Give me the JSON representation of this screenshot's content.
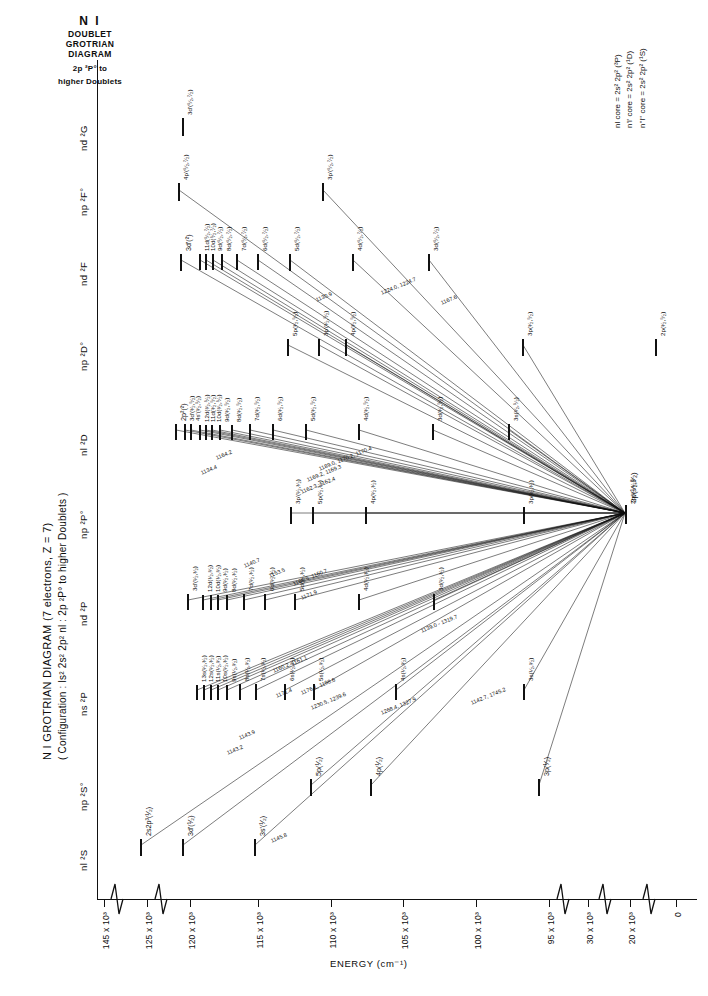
{
  "header": {
    "species": "N I",
    "subtitle_line1": "DOUBLET",
    "subtitle_line2": "GROTRIAN",
    "subtitle_line3": "DIAGRAM",
    "scope_line1": "2p ²P° to",
    "scope_line2": "higher  Doublets"
  },
  "caption": {
    "line1": "N I GROTRIAN DIAGRAM (7 electrons, Z = 7)",
    "line2": "( Configuration : ls² 2s² 2p² nl : 2p ²P° to higher Doublets )"
  },
  "core_legend": {
    "items": [
      "nl core = 2s² 2p² (³P)",
      "n'l' core = 2s² 2p² (¹D)",
      "n''l'' core = 2s² 2p² (¹S)"
    ]
  },
  "axes": {
    "energy_title": "ENERGY (cm⁻¹)",
    "ticks": [
      {
        "label": "145 x 10³",
        "x": 104
      },
      {
        "label": "125 x 10³",
        "x": 147
      },
      {
        "label": "120 x 10³",
        "x": 190
      },
      {
        "label": "115 x 10³",
        "x": 258
      },
      {
        "label": "110 x 10³",
        "x": 331
      },
      {
        "label": "105 x 10³",
        "x": 403
      },
      {
        "label": "100 x 10³",
        "x": 476
      },
      {
        "label": "95 x 10³",
        "x": 549
      },
      {
        "label": "30 x 10³",
        "x": 588
      },
      {
        "label": "20 x 10³",
        "x": 630
      },
      {
        "label": "0",
        "x": 676
      }
    ],
    "breaks_x": [
      116,
      160,
      562,
      604,
      648
    ]
  },
  "columns": [
    {
      "name": "nl-2S",
      "label": "nl ²S",
      "y": 845
    },
    {
      "name": "np-2So",
      "label": "np ²S°",
      "y": 785
    },
    {
      "name": "ns-2P",
      "label": "ns ²P",
      "y": 690
    },
    {
      "name": "nd-2P",
      "label": "nd ²P",
      "y": 600
    },
    {
      "name": "np-2Po",
      "label": "np ²P°",
      "y": 513
    },
    {
      "name": "nl-2D",
      "label": "nl ²D",
      "y": 430
    },
    {
      "name": "np-2Do",
      "label": "np ²D°",
      "y": 345
    },
    {
      "name": "nd-2F",
      "label": "nd ²F",
      "y": 260
    },
    {
      "name": "np-2Fo",
      "label": "np ²F°",
      "y": 190
    },
    {
      "name": "nd-2G",
      "label": "nd ²G",
      "y": 125
    }
  ],
  "levels": [
    {
      "col": "nd-2G",
      "label": "3d'(⁵⁄₂,⁷⁄₂)",
      "x": 182,
      "len": 14
    },
    {
      "col": "np-2Fo",
      "label": "4p'(⁵⁄₂,⁷⁄₂)",
      "x": 178,
      "len": 14
    },
    {
      "col": "np-2Fo",
      "label": "3p'(⁵⁄₂,⁷⁄₂)",
      "x": 322,
      "len": 14
    },
    {
      "col": "nd-2F",
      "label": "3d'(²)",
      "x": 180,
      "len": 13
    },
    {
      "col": "nd-2F",
      "label": "11d(⁵⁄₂,⁷⁄₂)",
      "x": 199,
      "len": 12
    },
    {
      "col": "nd-2F",
      "label": "10d(⁵⁄₂,⁷⁄₂)",
      "x": 205,
      "len": 12
    },
    {
      "col": "nd-2F",
      "label": "9d(⁵⁄₂,⁷⁄₂)",
      "x": 212,
      "len": 12
    },
    {
      "col": "nd-2F",
      "label": "8d(⁵⁄₂,⁷⁄₂)",
      "x": 221,
      "len": 12
    },
    {
      "col": "nd-2F",
      "label": "7d(⁵⁄₂,⁷⁄₂)",
      "x": 236,
      "len": 12
    },
    {
      "col": "nd-2F",
      "label": "6d(⁵⁄₂,⁷⁄₂)",
      "x": 257,
      "len": 12
    },
    {
      "col": "nd-2F",
      "label": "5d(⁵⁄₂,⁷⁄₂)",
      "x": 289,
      "len": 13
    },
    {
      "col": "nd-2F",
      "label": "4d(⁵⁄₂,⁷⁄₂)",
      "x": 352,
      "len": 13
    },
    {
      "col": "nd-2F",
      "label": "3d(⁵⁄₂,⁷⁄₂)",
      "x": 428,
      "len": 13
    },
    {
      "col": "np-2Do",
      "label": "5p(³⁄₂,⁵⁄₂)",
      "x": 287,
      "len": 13
    },
    {
      "col": "np-2Do",
      "label": "3p'(³⁄₂,⁵⁄₂)",
      "x": 318,
      "len": 13
    },
    {
      "col": "np-2Do",
      "label": "4p(³⁄₂,⁵⁄₂)",
      "x": 345,
      "len": 13
    },
    {
      "col": "np-2Do",
      "label": "3p(³⁄₂,⁵⁄₂)",
      "x": 522,
      "len": 13
    },
    {
      "col": "np-2Do",
      "label": "2p(³⁄₂,⁵⁄₂)",
      "x": 655,
      "len": 13
    },
    {
      "col": "nl-2D",
      "label": "2p²(²)",
      "x": 175,
      "len": 12
    },
    {
      "col": "nl-2D",
      "label": "3d'(³⁄₂,⁵⁄₂)",
      "x": 184,
      "len": 12
    },
    {
      "col": "nl-2D",
      "label": "4s'(³⁄₂,⁵⁄₂)",
      "x": 190,
      "len": 12
    },
    {
      "col": "nl-2D",
      "label": "12d(³⁄₂,⁵⁄₂)",
      "x": 199,
      "len": 11
    },
    {
      "col": "nl-2D",
      "label": "11d(³⁄₂,⁵⁄₂)",
      "x": 205,
      "len": 11
    },
    {
      "col": "nl-2D",
      "label": "10d(³⁄₂,⁵⁄₂)",
      "x": 211,
      "len": 11
    },
    {
      "col": "nl-2D",
      "label": "9d(³⁄₂,⁵⁄₂)",
      "x": 219,
      "len": 11
    },
    {
      "col": "nl-2D",
      "label": "8d(³⁄₂,⁵⁄₂)",
      "x": 231,
      "len": 11
    },
    {
      "col": "nl-2D",
      "label": "7d(³⁄₂,⁵⁄₂)",
      "x": 249,
      "len": 12
    },
    {
      "col": "nl-2D",
      "label": "6d(³⁄₂,⁵⁄₂)",
      "x": 272,
      "len": 12
    },
    {
      "col": "nl-2D",
      "label": "5d(³⁄₂,⁵⁄₂)",
      "x": 305,
      "len": 12
    },
    {
      "col": "nl-2D",
      "label": "4d(³⁄₂,⁵⁄₂)",
      "x": 358,
      "len": 12
    },
    {
      "col": "nl-2D",
      "label": "3d(³⁄₂,⁵⁄₂)",
      "x": 432,
      "len": 12
    },
    {
      "col": "nl-2D",
      "label": "3s(³⁄₂,⁵⁄₂)",
      "x": 508,
      "len": 12
    },
    {
      "col": "np-2Po",
      "label": "3p'(¹⁄₂,³⁄₂)",
      "x": 290,
      "len": 13
    },
    {
      "col": "np-2Po",
      "label": "5p(¹⁄₂,³⁄₂)",
      "x": 312,
      "len": 13
    },
    {
      "col": "np-2Po",
      "label": "4p(¹⁄₂,³⁄₂)",
      "x": 365,
      "len": 13
    },
    {
      "col": "np-2Po",
      "label": "3p(¹⁄₂,³⁄₂)",
      "x": 523,
      "len": 13
    },
    {
      "col": "np-2Po",
      "label": "2p(¹⁄₂,³⁄₂)",
      "x": 625,
      "len": 13
    },
    {
      "col": "nd-2P",
      "label": "3d'(¹⁄₂,³⁄₂)",
      "x": 187,
      "len": 12
    },
    {
      "col": "nd-2P",
      "label": "12d(¹⁄₂,³⁄₂)",
      "x": 202,
      "len": 11
    },
    {
      "col": "nd-2P",
      "label": "10d(¹⁄₂,³⁄₂)",
      "x": 210,
      "len": 11
    },
    {
      "col": "nd-2P",
      "label": "9d(¹⁄₂,³⁄₂)",
      "x": 217,
      "len": 11
    },
    {
      "col": "nd-2P",
      "label": "8d(¹⁄₂,³⁄₂)",
      "x": 226,
      "len": 11
    },
    {
      "col": "nd-2P",
      "label": "7d(¹⁄₂,³⁄₂)",
      "x": 243,
      "len": 12
    },
    {
      "col": "nd-2P",
      "label": "6d(¹⁄₂,³⁄₂)",
      "x": 264,
      "len": 12
    },
    {
      "col": "nd-2P",
      "label": "5d(¹⁄₂,³⁄₂)",
      "x": 294,
      "len": 12
    },
    {
      "col": "nd-2P",
      "label": "4d(¹⁄₂,³⁄₂)",
      "x": 358,
      "len": 12
    },
    {
      "col": "nd-2P",
      "label": "3d(¹⁄₂,³⁄₂)",
      "x": 433,
      "len": 12
    },
    {
      "col": "ns-2P",
      "label": "13s(¹⁄₂,³⁄₂)",
      "x": 196,
      "len": 11
    },
    {
      "col": "ns-2P",
      "label": "12s(¹⁄₂,³⁄₂)",
      "x": 203,
      "len": 11
    },
    {
      "col": "ns-2P",
      "label": "11s(¹⁄₂,³⁄₂)",
      "x": 210,
      "len": 11
    },
    {
      "col": "ns-2P",
      "label": "10s(¹⁄₂,³⁄₂)",
      "x": 217,
      "len": 11
    },
    {
      "col": "ns-2P",
      "label": "9s(¹⁄₂,³⁄₂)",
      "x": 226,
      "len": 11
    },
    {
      "col": "ns-2P",
      "label": "8s(¹⁄₂,³⁄₂)",
      "x": 239,
      "len": 12
    },
    {
      "col": "ns-2P",
      "label": "7s(¹⁄₂,³⁄₂)",
      "x": 255,
      "len": 12
    },
    {
      "col": "ns-2P",
      "label": "6s(¹⁄₂,³⁄₂)",
      "x": 284,
      "len": 12
    },
    {
      "col": "ns-2P",
      "label": "5s(¹⁄₂,³⁄₂)",
      "x": 313,
      "len": 12
    },
    {
      "col": "ns-2P",
      "label": "4s(¹⁄₂,³⁄₂)",
      "x": 395,
      "len": 12
    },
    {
      "col": "ns-2P",
      "label": "3s(¹⁄₂,³⁄₂)",
      "x": 523,
      "len": 12
    },
    {
      "col": "np-2So",
      "label": "5p(¹⁄₂)",
      "x": 310,
      "len": 13
    },
    {
      "col": "np-2So",
      "label": "4p(¹⁄₂)",
      "x": 370,
      "len": 13
    },
    {
      "col": "np-2So",
      "label": "3p(¹⁄₂)",
      "x": 538,
      "len": 13
    },
    {
      "col": "nl-2S",
      "label": "2s2p³(¹⁄₂)",
      "x": 140,
      "len": 13
    },
    {
      "col": "nl-2S",
      "label": "3d'(¹⁄₂)",
      "x": 182,
      "len": 13
    },
    {
      "col": "nl-2S",
      "label": "3s'(¹⁄₂)",
      "x": 254,
      "len": 13
    }
  ],
  "wavelengths": [
    {
      "text": "1140.7",
      "x": 243,
      "y": 563
    },
    {
      "text": "1153.5",
      "x": 268,
      "y": 573
    },
    {
      "text": "1160.5, 1160.7",
      "x": 292,
      "y": 581
    },
    {
      "text": "1171.9",
      "x": 300,
      "y": 595
    },
    {
      "text": "1160.2, 1161.1",
      "x": 272,
      "y": 668
    },
    {
      "text": "1171.4",
      "x": 275,
      "y": 693
    },
    {
      "text": "1176.1, 1198.6",
      "x": 300,
      "y": 690
    },
    {
      "text": "1230.5, 1239.6",
      "x": 310,
      "y": 705
    },
    {
      "text": "1268.4, 1327.9",
      "x": 380,
      "y": 710
    },
    {
      "text": "1142.7, 1745.2",
      "x": 470,
      "y": 700
    },
    {
      "text": "1189.0, 1170.2, 1170.4",
      "x": 318,
      "y": 466
    },
    {
      "text": "1169.2, 1169.3",
      "x": 306,
      "y": 477
    },
    {
      "text": "1162.3, 1162.4",
      "x": 300,
      "y": 489
    },
    {
      "text": "1130.9",
      "x": 315,
      "y": 297
    },
    {
      "text": "1224.0, 1224.7",
      "x": 380,
      "y": 290
    },
    {
      "text": "1167.6",
      "x": 440,
      "y": 300
    },
    {
      "text": "1139.0 - 1319.7",
      "x": 420,
      "y": 628
    },
    {
      "text": "1145.8",
      "x": 270,
      "y": 838
    },
    {
      "text": "1143.9",
      "x": 238,
      "y": 735
    },
    {
      "text": "1143.2",
      "x": 226,
      "y": 750
    },
    {
      "text": "1164.2",
      "x": 215,
      "y": 455
    },
    {
      "text": "1134.4",
      "x": 200,
      "y": 470
    }
  ],
  "ground_state": {
    "label": "2p(¹⁄₂,³⁄₂)",
    "x": 625,
    "y": 513
  }
}
